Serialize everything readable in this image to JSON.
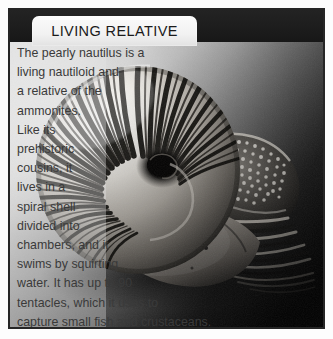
{
  "factbox": {
    "title": "LIVING RELATIVE",
    "frame_color": "#262626",
    "band_color": "#1d1d1d",
    "tab_color": "#f4f4f4",
    "text_color": "#3a3a3a"
  },
  "body": {
    "full_text": "The pearly nautilus is a living nautiloid and a relative of the ammonites. Like its prehistoric cousins, it lives in a spiral shell divided into chambers, and it swims by squirting water. It has up to 90 tentacles, which it uses to capture small fish and crustaceans.",
    "lines": [
      "The pearly nautilus is a",
      "living nautiloid and",
      "a relative of the",
      "ammonites.",
      "Like its",
      "prehistoric",
      "cousins, it",
      "lives in a",
      "spiral shell",
      "divided into",
      "chambers, and it",
      "swims by squirting",
      "water. It has up to 90",
      "tentacles, which it uses to",
      "capture small fish and crustaceans."
    ]
  },
  "photo": {
    "subject": "pearly-nautilus-shell",
    "description": "Black and white photograph of a pearly nautilus shell, spiral with radial stripes, tentacles and hood at right",
    "background_light": "#cfcfcf",
    "background_dark": "#050505"
  }
}
